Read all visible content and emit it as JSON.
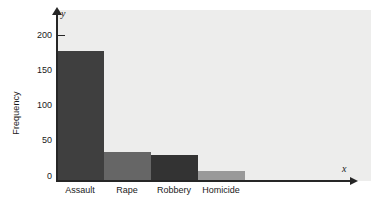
{
  "chart_data": {
    "type": "bar",
    "title": "",
    "subtitle": "",
    "categories": [
      "Assault",
      "Rape",
      "Robbery",
      "Homicide"
    ],
    "values": [
      164,
      37,
      33,
      12
    ],
    "xlabel": "x",
    "ylabel": "Frequency",
    "y_axis_letter": "y",
    "x_axis_letter": "x",
    "ylim": [
      0,
      215
    ],
    "yticks": [
      0,
      50,
      100,
      150,
      200
    ],
    "ytick_labels": [
      "0",
      "50",
      "100",
      "150",
      "200"
    ],
    "grid": false,
    "legend": null,
    "bar_colors": [
      "#3f3f3f",
      "#666666",
      "#333333",
      "#999999"
    ],
    "plot_background": "#ededec",
    "axis_color": "#262626",
    "figure_background": "#ffffff",
    "annotations": []
  }
}
